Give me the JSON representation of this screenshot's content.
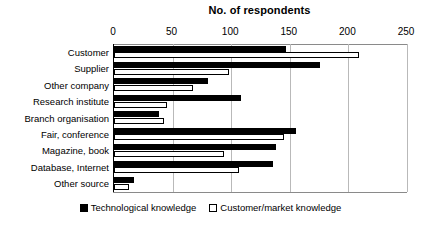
{
  "chart_data": {
    "type": "bar",
    "orientation": "horizontal",
    "title": "No. of respondents",
    "xlabel": "",
    "ylabel": "",
    "xlim": [
      0,
      250
    ],
    "xticks": [
      0,
      50,
      100,
      150,
      200,
      250
    ],
    "xtick_labels": [
      "0",
      "50",
      "100",
      "150",
      "200",
      "250"
    ],
    "grid": true,
    "grid_axis": "x",
    "legend_position": "bottom",
    "categories": [
      "Customer",
      "Supplier",
      "Other company",
      "Research institute",
      "Branch organisation",
      "Fair, conference",
      "Magazine, book",
      "Database, Internet",
      "Other source"
    ],
    "series": [
      {
        "name": "Technological knowledge",
        "color": "#000000",
        "style": "filled",
        "values": [
          147,
          176,
          80,
          108,
          38,
          155,
          138,
          136,
          17
        ]
      },
      {
        "name": "Customer/market knowledge",
        "color": "#ffffff",
        "style": "hollow",
        "values": [
          209,
          98,
          67,
          45,
          43,
          145,
          94,
          107,
          13
        ]
      }
    ]
  }
}
